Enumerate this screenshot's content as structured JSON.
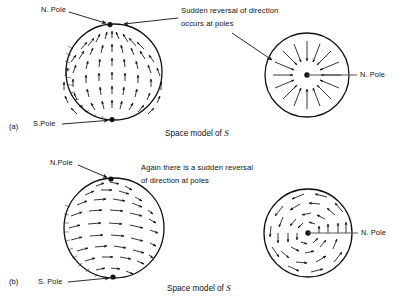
{
  "figure": {
    "title_caption_a": "Space model of",
    "title_caption_b": "Space model of",
    "symbol": "S"
  },
  "panel_a": {
    "id": "(a)",
    "sphere": {
      "north_pole_label": "N. Pole",
      "south_pole_label": "S.Pole",
      "field_type": "meridional",
      "arrow_direction": "south-to-north along meridians"
    },
    "polar_view": {
      "north_pole_label": "N. Pole",
      "field_type": "radial-inward",
      "ray_count": 16
    },
    "annotation_line1": "Sudden reversal of direction",
    "annotation_line2": "occurs at poles",
    "caption": "Space model of S"
  },
  "panel_b": {
    "id": "(b)",
    "sphere": {
      "north_pole_label": "N.Pole",
      "south_pole_label": "S. Pole",
      "field_type": "latitudinal",
      "arrow_direction": "eastward along parallels"
    },
    "polar_view": {
      "north_pole_label": "N. Pole",
      "field_type": "circulating",
      "ring_count": 4
    },
    "annotation_line1": "Again there is a sudden reversal",
    "annotation_line2": "of direction at poles",
    "caption": "Space model of S"
  },
  "colors": {
    "ink": "#111111",
    "background": "#ffffff"
  }
}
